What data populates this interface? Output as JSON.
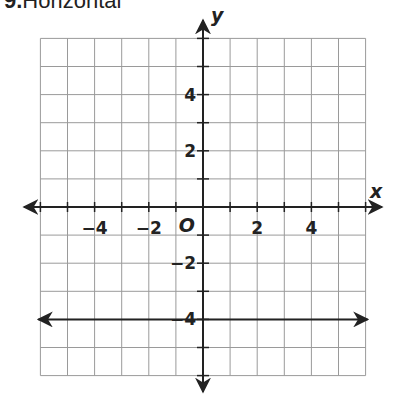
{
  "header": {
    "number": "9.",
    "text": "Horizontal"
  },
  "chart_data": {
    "type": "line",
    "title": "Horizontal",
    "xlabel": "x",
    "ylabel": "y",
    "origin_label": "O",
    "xlim": [
      -6,
      6
    ],
    "ylim": [
      -6,
      6
    ],
    "grid": true,
    "x_ticks_labeled": [
      -4,
      -2,
      2,
      4
    ],
    "y_ticks_labeled": [
      4,
      2,
      -2,
      -4
    ],
    "x_tick_labels": [
      "−4",
      "−2",
      "2",
      "4"
    ],
    "y_tick_labels": [
      "4",
      "2",
      "−2",
      "−4"
    ],
    "series": [
      {
        "name": "horizontal line",
        "equation": "y = -4",
        "x": [
          -6,
          6
        ],
        "y": [
          -4,
          -4
        ]
      }
    ]
  }
}
